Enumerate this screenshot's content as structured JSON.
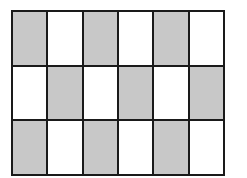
{
  "grid": {
    "rows": 3,
    "cols": 6,
    "colors": {
      "shaded": "#c8c8c8",
      "unshaded": "#ffffff",
      "border": "#1a1a1a"
    },
    "cells": [
      [
        1,
        0,
        1,
        0,
        1,
        0
      ],
      [
        0,
        1,
        0,
        1,
        0,
        1
      ],
      [
        1,
        0,
        1,
        0,
        1,
        0
      ]
    ],
    "shaded_count": 9,
    "total_count": 18
  }
}
